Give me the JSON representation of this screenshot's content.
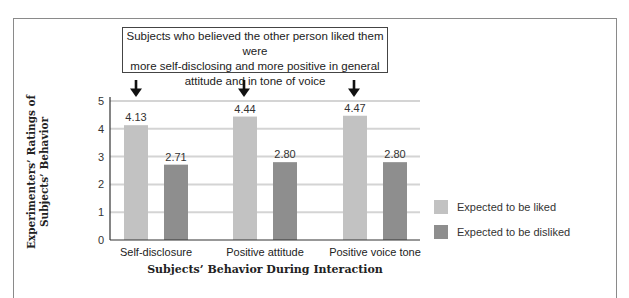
{
  "chart_data": {
    "type": "bar",
    "title": "",
    "annotation": "Subjects who believed the other person liked them were more self-disclosing and more positive in general attitude and in tone of voice",
    "categories": [
      "Self-disclosure",
      "Positive attitude",
      "Positive voice tone"
    ],
    "series": [
      {
        "name": "Expected to be liked",
        "values": [
          4.13,
          4.44,
          4.47
        ],
        "color": "#c2c2c2"
      },
      {
        "name": "Expected to be disliked",
        "values": [
          2.71,
          2.8,
          2.8
        ],
        "color": "#8e8e8e"
      }
    ],
    "data_labels": [
      [
        "4.13",
        "4.44",
        "4.47"
      ],
      [
        "2.71",
        "2.80",
        "2.80"
      ]
    ],
    "xlabel": "Subjects’ Behavior During Interaction",
    "ylabel_lines": [
      "Experimenters’ Ratings of",
      "Subjects’ Behavior"
    ],
    "ylim": [
      0,
      5
    ],
    "yticks": [
      "0",
      "1",
      "2",
      "3",
      "4",
      "5"
    ],
    "grid": true,
    "legend_position": "right",
    "arrows_on": [
      "Expected to be liked"
    ]
  },
  "callout": {
    "line1": "Subjects who believed the other person liked them were",
    "line2": "more self-disclosing and more positive in general",
    "line3": "attitude and in tone of voice"
  },
  "legend": [
    {
      "label": "Expected to be liked",
      "color": "#c2c2c2"
    },
    {
      "label": "Expected to be disliked",
      "color": "#8e8e8e"
    }
  ],
  "colors": {
    "grid": "#d4d4d4",
    "axis": "#333333",
    "frame": "#8a8a8a"
  }
}
